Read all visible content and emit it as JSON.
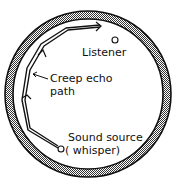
{
  "diagram": {
    "labels": {
      "listener": "Listener",
      "creep_line1": "Creep echo",
      "creep_line2": "path",
      "source_line1": "Sound source",
      "source_line2": "( whisper)"
    },
    "colors": {
      "stroke": "#111111",
      "wall_fill": "#bdbdbd",
      "background": "#ffffff"
    }
  }
}
